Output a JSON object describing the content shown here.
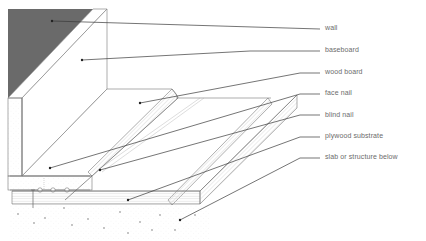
{
  "diagram": {
    "type": "cross-section",
    "labels": [
      {
        "id": "wall",
        "text": "wall",
        "x": 325,
        "y": 24
      },
      {
        "id": "baseboard",
        "text": "baseboard",
        "x": 325,
        "y": 46
      },
      {
        "id": "wood-board",
        "text": "wood board",
        "x": 325,
        "y": 67
      },
      {
        "id": "face-nail",
        "text": "face nail",
        "x": 325,
        "y": 89
      },
      {
        "id": "blind-nail",
        "text": "blind nail",
        "x": 325,
        "y": 110
      },
      {
        "id": "plywood-substrate",
        "text": "plywood substrate",
        "x": 325,
        "y": 132
      },
      {
        "id": "slab",
        "text": "slab or structure below",
        "x": 325,
        "y": 153
      }
    ],
    "colors": {
      "wall_fill": "#6a6a6a",
      "line": "#555555",
      "leader": "#3a3a3a",
      "label_text": "#6b6b6b",
      "hatch": "#bdbdbd"
    }
  }
}
